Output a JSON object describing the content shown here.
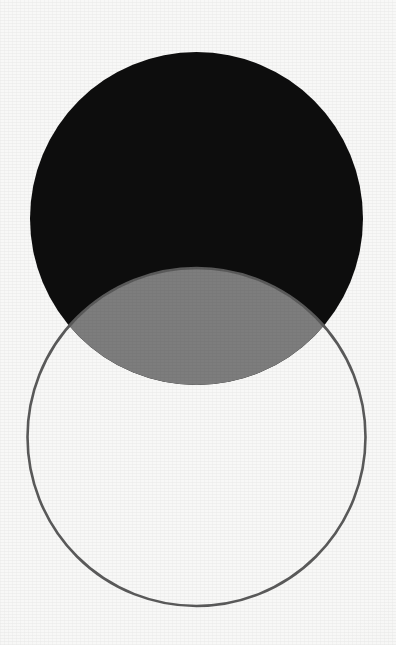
{
  "figure": {
    "title": "Two-circle Venn diagram",
    "canvas": {
      "width": 396,
      "height": 645,
      "background_color": "#f8f8f7"
    },
    "palette": {
      "background": "#f8f8f7",
      "set_a_fill": "#0d0d0d",
      "set_b_fill": "none",
      "set_b_stroke": "#5a5a5a",
      "intersection_fill": "#7d7d7d"
    },
    "shapes": [
      {
        "id": "set-a",
        "role": "upper-set",
        "shape": "circle",
        "cx": 196.5,
        "cy": 218.5,
        "r": 166.5,
        "fill": "#0d0d0d",
        "stroke": "none",
        "stroke_width": 0,
        "label": ""
      },
      {
        "id": "set-b",
        "role": "lower-set",
        "shape": "circle",
        "cx": 196.5,
        "cy": 437,
        "r": 169,
        "fill": "none",
        "stroke": "#5a5a5a",
        "stroke_width": 2.6,
        "label": ""
      },
      {
        "id": "intersection",
        "role": "overlap-lens",
        "shape": "lens",
        "fill": "#7d7d7d",
        "stroke": "none",
        "stroke_width": 0,
        "top_y": 268,
        "bottom_y": 385,
        "left_x": 68,
        "right_x": 325,
        "label": ""
      }
    ],
    "intersection_points": [
      {
        "id": "left-crossing",
        "x": 68,
        "y": 335
      },
      {
        "id": "right-crossing",
        "x": 325,
        "y": 335
      }
    ],
    "bounds": {
      "set_a_top": 52,
      "set_a_bottom": 385,
      "set_a_left": 30,
      "set_a_right": 363,
      "set_b_top": 268,
      "set_b_bottom": 606,
      "set_b_left": 30,
      "set_b_right": 363
    },
    "annotations": []
  }
}
